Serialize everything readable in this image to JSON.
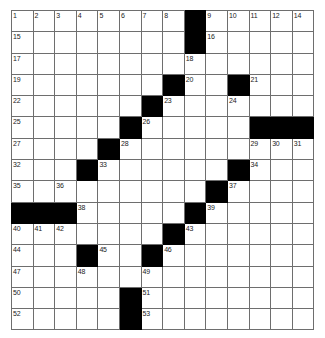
{
  "puzzle": {
    "type": "crossword-grid",
    "columns": 14,
    "rows": 15,
    "cell_width_px": 21.6,
    "cell_height_px": 21.3,
    "colors": {
      "block_fill": "#000000",
      "cell_fill": "#ffffff",
      "grid_line": "#6e6e6e",
      "number_text": "#222222",
      "page_background": "#ffffff"
    },
    "blocks": [
      [
        0,
        8
      ],
      [
        1,
        8
      ],
      [
        3,
        7
      ],
      [
        3,
        10
      ],
      [
        4,
        6
      ],
      [
        5,
        5
      ],
      [
        5,
        11
      ],
      [
        5,
        12
      ],
      [
        5,
        13
      ],
      [
        6,
        4
      ],
      [
        7,
        3
      ],
      [
        7,
        10
      ],
      [
        8,
        9
      ],
      [
        9,
        0
      ],
      [
        9,
        1
      ],
      [
        9,
        2
      ],
      [
        9,
        8
      ],
      [
        10,
        7
      ],
      [
        11,
        3
      ],
      [
        11,
        6
      ],
      [
        13,
        5
      ],
      [
        14,
        5
      ]
    ],
    "numbers": {
      "0": {
        "0": "1",
        "1": "2",
        "2": "3",
        "3": "4",
        "4": "5",
        "5": "6",
        "6": "7",
        "7": "8",
        "9": "9",
        "10": "10",
        "11": "11",
        "12": "12",
        "13": "13"
      },
      "1": {
        "0": "15",
        "9": "16"
      },
      "2": {
        "0": "17",
        "8": "18"
      },
      "3": {
        "0": "19",
        "8": "20",
        "11": "21"
      },
      "4": {
        "0": "22",
        "7": "23",
        "10": "24"
      },
      "5": {
        "0": "25",
        "6": "26"
      },
      "6": {
        "0": "27",
        "5": "28",
        "11": "29",
        "12": "30",
        "13": "31"
      },
      "7": {
        "0": "32",
        "4": "33",
        "11": "34"
      },
      "8": {
        "0": "35",
        "2": "36",
        "10": "37"
      },
      "9": {
        "3": "38",
        "9": "39"
      },
      "10": {
        "0": "40",
        "1": "41",
        "2": "42",
        "8": "43"
      },
      "11": {
        "0": "44",
        "4": "45",
        "7": "46"
      },
      "12": {
        "0": "47",
        "3": "48",
        "6": "49"
      },
      "13": {
        "0": "50",
        "6": "51"
      },
      "14": {
        "0": "52",
        "6": "53"
      }
    },
    "extra_numbers": {
      "row0_col14_label": "14"
    }
  }
}
